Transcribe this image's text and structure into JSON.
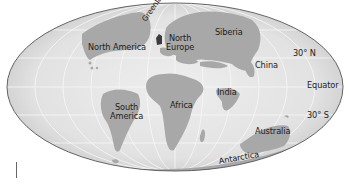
{
  "map": {
    "projection": "mollweide-style ellipse",
    "colors": {
      "ocean": "#e6e6e6",
      "ocean_edge": "#c4c4c4",
      "land": "#a6a6a6",
      "land_dark": "#8f8f8f",
      "greenland": "#3a3a3a",
      "grid": "#f6f6f6",
      "outline": "#555555",
      "label": "#222222"
    },
    "labels": {
      "north_america": "North America",
      "greenland": "Greenland",
      "north_europe_line1": "North",
      "north_europe_line2": "Europe",
      "siberia": "Siberia",
      "china": "China",
      "india": "India",
      "africa": "Africa",
      "south_america_line1": "South",
      "south_america_line2": "America",
      "australia": "Australia",
      "antarctica": "Antarctica"
    },
    "latitudes": {
      "n30": "30° N",
      "equator": "Equator",
      "s30": "30° S"
    }
  }
}
